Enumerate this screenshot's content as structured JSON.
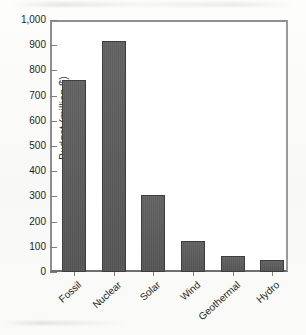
{
  "chart_data": {
    "type": "bar",
    "title": "",
    "subtitle": "",
    "xlabel": "",
    "ylabel": "Budget (million $)",
    "categories": [
      "Fossil",
      "Nuclear",
      "Solar",
      "Wind",
      "Geothermal",
      "Hydro"
    ],
    "values": [
      760,
      915,
      305,
      125,
      62,
      47
    ],
    "series": [
      {
        "name": "Budget",
        "values": [
          760,
          915,
          305,
          125,
          62,
          47
        ]
      }
    ],
    "ylim": [
      0,
      1000
    ],
    "y_tick_labels": [
      "0",
      "100",
      "200",
      "300",
      "400",
      "500",
      "600",
      "700",
      "800",
      "900",
      "1,000"
    ],
    "y_tick_values": [
      0,
      100,
      200,
      300,
      400,
      500,
      600,
      700,
      800,
      900,
      1000
    ],
    "y_tick_interval": 100,
    "grid": false,
    "legend": false,
    "legend_position": "none",
    "annotations": [],
    "colors": {
      "bar_fill": "#5a5a5a",
      "bar_edge": "#3e3e3e",
      "axis": "#8e8e8e",
      "text": "#1f1f1f",
      "plot_background": "#ffffff",
      "page_background": "#fbfbf9"
    }
  }
}
